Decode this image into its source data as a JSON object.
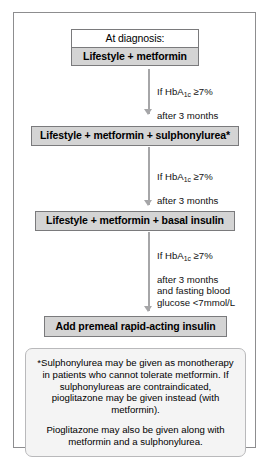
{
  "diagram": {
    "nodes": [
      {
        "id": "header",
        "label": "At diagnosis:",
        "style": "plain"
      },
      {
        "id": "step1",
        "label": "Lifestyle + metformin",
        "style": "primary"
      },
      {
        "id": "step2",
        "label": "Lifestyle + metformin + sulphonylurea*",
        "style": "primary"
      },
      {
        "id": "step3",
        "label": "Lifestyle + metformin + basal insulin",
        "style": "primary"
      },
      {
        "id": "step4",
        "label": "Add premeal rapid-acting insulin",
        "style": "primary"
      }
    ],
    "conditions": [
      {
        "id": "cond1",
        "line1_prefix": "If HbA",
        "line1_sub": "1c",
        "line1_suffix": " ≥7%",
        "rest": "after 3 months"
      },
      {
        "id": "cond2",
        "line1_prefix": "If HbA",
        "line1_sub": "1c",
        "line1_suffix": " ≥7%",
        "rest": "after 3 months"
      },
      {
        "id": "cond3",
        "line1_prefix": "If HbA",
        "line1_sub": "1c",
        "line1_suffix": " ≥7%",
        "rest": "after 3 months\nand fasting blood\nglucose <7mmol/L"
      }
    ],
    "footnote": {
      "paragraph1": "*Sulphonylurea may be given as monotherapy in patients who cannot tolerate metformin. If sulphonylureas are contraindicated, pioglitazone may be given instead (with metformin).",
      "paragraph2": "Pioglitazone may also be given along with metformin and a sulphonylurea."
    },
    "colors": {
      "node_fill": "#d4d4d4",
      "node_border": "#7a7a7c",
      "plain_fill": "#ffffff",
      "arrow": "#a6a6a8",
      "footnote_fill": "#f4f4f4",
      "footnote_border": "#b9b9bb",
      "frame_border": "#8d8d8f"
    }
  }
}
